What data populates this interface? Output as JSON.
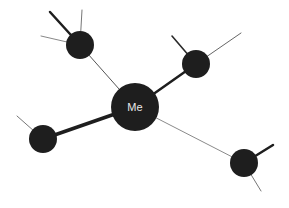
{
  "diagram": {
    "type": "network",
    "background": "#ffffff",
    "node_color": "#1e1e1e",
    "center_node": {
      "id": "me",
      "label": "Me",
      "cx": 135,
      "cy": 107,
      "r": 24
    },
    "nodes": [
      {
        "id": "node-top-left",
        "label": "",
        "cx": 80,
        "cy": 45,
        "r": 14
      },
      {
        "id": "node-upper-right",
        "label": "",
        "cx": 196,
        "cy": 64,
        "r": 14
      },
      {
        "id": "node-left",
        "label": "",
        "cx": 43,
        "cy": 139,
        "r": 14
      },
      {
        "id": "node-lower-right",
        "label": "",
        "cx": 244,
        "cy": 163,
        "r": 14
      }
    ],
    "edges": [
      {
        "from": "me",
        "to": "node-top-left",
        "weight": "thin",
        "x1": 135,
        "y1": 107,
        "x2": 80,
        "y2": 45,
        "width": 1,
        "color": "#555555"
      },
      {
        "from": "me",
        "to": "node-upper-right",
        "weight": "thick",
        "x1": 135,
        "y1": 107,
        "x2": 196,
        "y2": 64,
        "width": 2.5,
        "color": "#1e1e1e"
      },
      {
        "from": "me",
        "to": "node-left",
        "weight": "thick",
        "x1": 135,
        "y1": 107,
        "x2": 43,
        "y2": 139,
        "width": 3.5,
        "color": "#1e1e1e"
      },
      {
        "from": "me",
        "to": "node-lower-right",
        "weight": "thin",
        "x1": 135,
        "y1": 107,
        "x2": 244,
        "y2": 163,
        "width": 1,
        "color": "#8a8a8a"
      }
    ],
    "spokes": [
      {
        "from": "node-top-left",
        "weight": "thick",
        "x1": 80,
        "y1": 45,
        "x2": 50,
        "y2": 12,
        "width": 2.5,
        "color": "#1e1e1e"
      },
      {
        "from": "node-top-left",
        "weight": "thin",
        "x1": 80,
        "y1": 45,
        "x2": 82,
        "y2": 10,
        "width": 1,
        "color": "#777777"
      },
      {
        "from": "node-top-left",
        "weight": "thin",
        "x1": 80,
        "y1": 45,
        "x2": 41,
        "y2": 36,
        "width": 1,
        "color": "#888888"
      },
      {
        "from": "node-upper-right",
        "weight": "medium",
        "x1": 196,
        "y1": 64,
        "x2": 172,
        "y2": 36,
        "width": 1.6,
        "color": "#2a2a2a"
      },
      {
        "from": "node-upper-right",
        "weight": "thin",
        "x1": 196,
        "y1": 64,
        "x2": 241,
        "y2": 33,
        "width": 1,
        "color": "#666666"
      },
      {
        "from": "node-left",
        "weight": "thin",
        "x1": 43,
        "y1": 139,
        "x2": 17,
        "y2": 116,
        "width": 1,
        "color": "#777777"
      },
      {
        "from": "node-lower-right",
        "weight": "thick",
        "x1": 244,
        "y1": 163,
        "x2": 273,
        "y2": 145,
        "width": 2.5,
        "color": "#1e1e1e"
      },
      {
        "from": "node-lower-right",
        "weight": "thin",
        "x1": 244,
        "y1": 163,
        "x2": 261,
        "y2": 191,
        "width": 1,
        "color": "#777777"
      }
    ]
  }
}
